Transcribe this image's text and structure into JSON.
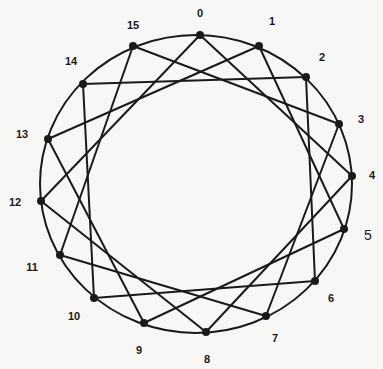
{
  "diagram": {
    "type": "circulant-graph",
    "node_count": 16,
    "jump": 4,
    "circle": {
      "cx": 196,
      "cy": 184,
      "rx": 156,
      "ry": 149
    },
    "colors": {
      "stroke": "#1a1a1a",
      "background": "#f7f7f5"
    },
    "nodes": [
      {
        "id": 0,
        "label": "0",
        "x": 200,
        "y": 35,
        "lx": 200,
        "ly": 17
      },
      {
        "id": 1,
        "label": "1",
        "x": 259,
        "y": 46,
        "lx": 272,
        "ly": 25
      },
      {
        "id": 2,
        "label": "2",
        "x": 306,
        "y": 77,
        "lx": 322,
        "ly": 61
      },
      {
        "id": 3,
        "label": "3",
        "x": 339,
        "y": 124,
        "lx": 361,
        "ly": 123
      },
      {
        "id": 4,
        "label": "4",
        "x": 352,
        "y": 176,
        "lx": 372,
        "ly": 179
      },
      {
        "id": 5,
        "label": "5",
        "x": 344,
        "y": 229,
        "lx": 368,
        "ly": 240,
        "big": true
      },
      {
        "id": 6,
        "label": "6",
        "x": 315,
        "y": 281,
        "lx": 331,
        "ly": 302
      },
      {
        "id": 7,
        "label": "7",
        "x": 266,
        "y": 316,
        "lx": 275,
        "ly": 342
      },
      {
        "id": 8,
        "label": "8",
        "x": 206,
        "y": 332,
        "lx": 207,
        "ly": 363
      },
      {
        "id": 9,
        "label": "9",
        "x": 144,
        "y": 323,
        "lx": 139,
        "ly": 354
      },
      {
        "id": 10,
        "label": "10",
        "x": 94,
        "y": 298,
        "lx": 74,
        "ly": 320
      },
      {
        "id": 11,
        "label": "11",
        "x": 60,
        "y": 255,
        "lx": 32,
        "ly": 271
      },
      {
        "id": 12,
        "label": "12",
        "x": 41,
        "y": 201,
        "lx": 15,
        "ly": 206
      },
      {
        "id": 13,
        "label": "13",
        "x": 48,
        "y": 139,
        "lx": 22,
        "ly": 138
      },
      {
        "id": 14,
        "label": "14",
        "x": 83,
        "y": 84,
        "lx": 71,
        "ly": 65
      },
      {
        "id": 15,
        "label": "15",
        "x": 133,
        "y": 46,
        "lx": 133,
        "ly": 29
      }
    ],
    "edges": [
      [
        0,
        4
      ],
      [
        4,
        8
      ],
      [
        8,
        12
      ],
      [
        12,
        0
      ],
      [
        1,
        5
      ],
      [
        5,
        9
      ],
      [
        9,
        13
      ],
      [
        13,
        1
      ],
      [
        2,
        6
      ],
      [
        6,
        10
      ],
      [
        10,
        14
      ],
      [
        14,
        2
      ],
      [
        3,
        7
      ],
      [
        7,
        11
      ],
      [
        11,
        15
      ],
      [
        15,
        3
      ]
    ]
  }
}
